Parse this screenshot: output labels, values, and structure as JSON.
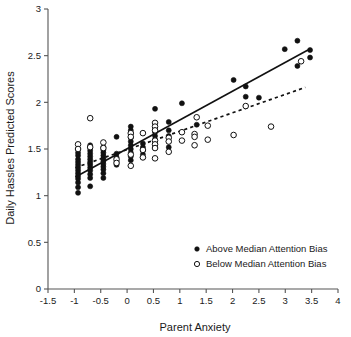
{
  "chart_data": {
    "type": "scatter",
    "title": "",
    "xlabel": "Parent Anxiety",
    "ylabel": "Daily Hassles Predicted Scores",
    "xlim": [
      -1.5,
      4
    ],
    "ylim": [
      0,
      3
    ],
    "xticks": [
      -1.5,
      -1,
      -0.5,
      0,
      0.5,
      1,
      1.5,
      2,
      2.5,
      3,
      3.5,
      4
    ],
    "xtick_labels": [
      "-1.5",
      "-1",
      "-0.5",
      "0",
      "0.5",
      "1",
      "1.5",
      "2",
      "2.5",
      "3",
      "3.5",
      "4"
    ],
    "yticks": [
      0,
      0.5,
      1,
      1.5,
      2,
      2.5,
      3
    ],
    "ytick_labels": [
      "0",
      "0.5",
      "1",
      "1.5",
      "2",
      "2.5",
      "3"
    ],
    "grid": false,
    "legend_position": "lower-right",
    "legend": [
      {
        "marker": "filled-circle",
        "label": "Above Median Attention Bias"
      },
      {
        "marker": "open-circle",
        "label": "Below Median Attention Bias"
      }
    ],
    "series": [
      {
        "name": "Above Median Attention Bias",
        "marker": "filled-circle",
        "color": "#111111",
        "points": [
          [
            -0.93,
            1.03
          ],
          [
            -0.93,
            1.09
          ],
          [
            -0.93,
            1.14
          ],
          [
            -0.93,
            1.18
          ],
          [
            -0.93,
            1.21
          ],
          [
            -0.93,
            1.24
          ],
          [
            -0.93,
            1.27
          ],
          [
            -0.93,
            1.3
          ],
          [
            -0.93,
            1.33
          ],
          [
            -0.93,
            1.36
          ],
          [
            -0.93,
            1.39
          ],
          [
            -0.93,
            1.43
          ],
          [
            -0.93,
            1.46
          ],
          [
            -0.93,
            1.5
          ],
          [
            -0.7,
            1.1
          ],
          [
            -0.7,
            1.19
          ],
          [
            -0.7,
            1.23
          ],
          [
            -0.7,
            1.27
          ],
          [
            -0.7,
            1.3
          ],
          [
            -0.7,
            1.33
          ],
          [
            -0.7,
            1.36
          ],
          [
            -0.7,
            1.39
          ],
          [
            -0.7,
            1.42
          ],
          [
            -0.7,
            1.45
          ],
          [
            -0.7,
            1.48
          ],
          [
            -0.7,
            1.51
          ],
          [
            -0.7,
            1.54
          ],
          [
            -0.45,
            1.19
          ],
          [
            -0.45,
            1.24
          ],
          [
            -0.45,
            1.28
          ],
          [
            -0.45,
            1.31
          ],
          [
            -0.45,
            1.34
          ],
          [
            -0.45,
            1.37
          ],
          [
            -0.45,
            1.4
          ],
          [
            -0.45,
            1.43
          ],
          [
            -0.45,
            1.46
          ],
          [
            -0.45,
            1.49
          ],
          [
            -0.45,
            1.52
          ],
          [
            -0.2,
            1.63
          ],
          [
            -0.2,
            1.33
          ],
          [
            -0.2,
            1.37
          ],
          [
            -0.2,
            1.41
          ],
          [
            -0.2,
            1.45
          ],
          [
            0.07,
            1.74
          ],
          [
            0.07,
            1.7
          ],
          [
            0.07,
            1.66
          ],
          [
            0.07,
            1.62
          ],
          [
            0.07,
            1.58
          ],
          [
            0.07,
            1.54
          ],
          [
            0.07,
            1.5
          ],
          [
            0.07,
            1.46
          ],
          [
            0.07,
            1.42
          ],
          [
            0.07,
            1.38
          ],
          [
            0.3,
            1.56
          ],
          [
            0.3,
            1.52
          ],
          [
            0.3,
            1.48
          ],
          [
            0.3,
            1.44
          ],
          [
            0.3,
            1.41
          ],
          [
            0.53,
            1.93
          ],
          [
            0.53,
            1.72
          ],
          [
            0.53,
            1.68
          ],
          [
            0.53,
            1.64
          ],
          [
            0.53,
            1.6
          ],
          [
            0.53,
            1.56
          ],
          [
            0.53,
            1.52
          ],
          [
            0.79,
            1.79
          ],
          [
            0.79,
            1.7
          ],
          [
            0.79,
            1.64
          ],
          [
            0.79,
            1.58
          ],
          [
            0.79,
            1.52
          ],
          [
            1.04,
            1.99
          ],
          [
            1.32,
            1.76
          ],
          [
            2.02,
            2.24
          ],
          [
            2.25,
            2.17
          ],
          [
            2.25,
            2.06
          ],
          [
            2.5,
            2.05
          ],
          [
            2.99,
            2.57
          ],
          [
            3.23,
            2.66
          ],
          [
            3.23,
            2.39
          ],
          [
            3.47,
            2.56
          ],
          [
            3.47,
            2.48
          ]
        ]
      },
      {
        "name": "Below Median Attention Bias",
        "marker": "open-circle",
        "color": "#111111",
        "points": [
          [
            -0.93,
            1.55
          ],
          [
            -0.93,
            1.5
          ],
          [
            -0.7,
            1.83
          ],
          [
            -0.7,
            1.52
          ],
          [
            -0.45,
            1.57
          ],
          [
            -0.45,
            1.51
          ],
          [
            -0.2,
            1.39
          ],
          [
            -0.2,
            1.35
          ],
          [
            0.07,
            1.67
          ],
          [
            0.07,
            1.63
          ],
          [
            0.07,
            1.44
          ],
          [
            0.07,
            1.32
          ],
          [
            0.3,
            1.67
          ],
          [
            0.3,
            1.49
          ],
          [
            0.3,
            1.41
          ],
          [
            0.53,
            1.78
          ],
          [
            0.53,
            1.74
          ],
          [
            0.53,
            1.7
          ],
          [
            0.53,
            1.59
          ],
          [
            0.53,
            1.55
          ],
          [
            0.53,
            1.51
          ],
          [
            0.53,
            1.4
          ],
          [
            0.79,
            1.62
          ],
          [
            0.79,
            1.58
          ],
          [
            0.79,
            1.47
          ],
          [
            1.04,
            1.68
          ],
          [
            1.04,
            1.59
          ],
          [
            1.28,
            1.66
          ],
          [
            1.28,
            1.63
          ],
          [
            1.28,
            1.54
          ],
          [
            1.32,
            1.84
          ],
          [
            1.53,
            1.75
          ],
          [
            1.53,
            1.6
          ],
          [
            2.02,
            1.65
          ],
          [
            2.25,
            1.96
          ],
          [
            2.73,
            1.74
          ],
          [
            3.3,
            2.44
          ]
        ]
      }
    ],
    "trend_lines": [
      {
        "name": "Above Median Attention Bias fit",
        "style": "solid",
        "color": "#111111",
        "x_start": -0.98,
        "y_start": 1.2,
        "x_end": 3.43,
        "y_end": 2.56
      },
      {
        "name": "Below Median Attention Bias fit",
        "style": "dashed",
        "color": "#111111",
        "x_start": -0.98,
        "y_start": 1.3,
        "x_end": 3.38,
        "y_end": 2.16
      }
    ]
  }
}
